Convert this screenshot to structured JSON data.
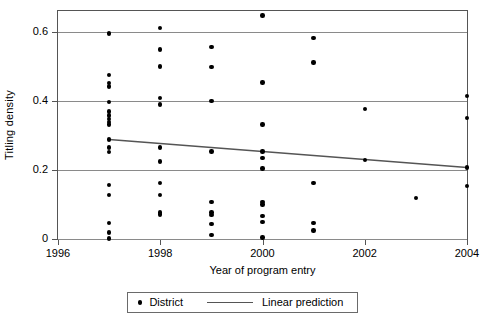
{
  "chart_data": {
    "type": "scatter",
    "title": "",
    "xlabel": "Year of program entry",
    "ylabel": "Titling density",
    "xlim": [
      1996,
      2004
    ],
    "ylim": [
      0,
      0.66
    ],
    "xticks": [
      1996,
      1998,
      2000,
      2002,
      2004
    ],
    "xtick_labels": [
      "1996",
      "1998",
      "2000",
      "2002",
      "2004"
    ],
    "yticks": [
      0,
      0.2,
      0.4,
      0.6
    ],
    "ytick_labels": [
      "0",
      "0.2",
      "0.4",
      "0.6"
    ],
    "grid": "horizontal",
    "legend_position": "below",
    "series": [
      {
        "name": "District",
        "type": "scatter",
        "marker": "circle",
        "color": "#000000",
        "points": [
          [
            1997,
            0.595
          ],
          [
            1997,
            0.475
          ],
          [
            1997,
            0.452
          ],
          [
            1997,
            0.442
          ],
          [
            1997,
            0.396
          ],
          [
            1997,
            0.369
          ],
          [
            1997,
            0.357
          ],
          [
            1997,
            0.347
          ],
          [
            1997,
            0.338
          ],
          [
            1997,
            0.331
          ],
          [
            1997,
            0.288
          ],
          [
            1997,
            0.265
          ],
          [
            1997,
            0.252
          ],
          [
            1997,
            0.157
          ],
          [
            1997,
            0.127
          ],
          [
            1997,
            0.046
          ],
          [
            1997,
            0.019
          ],
          [
            1997,
            0.001
          ],
          [
            1998,
            0.611
          ],
          [
            1998,
            0.549
          ],
          [
            1998,
            0.499
          ],
          [
            1998,
            0.408
          ],
          [
            1998,
            0.389
          ],
          [
            1998,
            0.265
          ],
          [
            1998,
            0.224
          ],
          [
            1998,
            0.163
          ],
          [
            1998,
            0.127
          ],
          [
            1998,
            0.077
          ],
          [
            1998,
            0.071
          ],
          [
            1999,
            0.556
          ],
          [
            1999,
            0.498
          ],
          [
            1999,
            0.4
          ],
          [
            1999,
            0.253
          ],
          [
            1999,
            0.108
          ],
          [
            1999,
            0.077
          ],
          [
            1999,
            0.07
          ],
          [
            1999,
            0.044
          ],
          [
            1999,
            0.012
          ],
          [
            2000,
            0.647
          ],
          [
            2000,
            0.453
          ],
          [
            2000,
            0.331
          ],
          [
            2000,
            0.253
          ],
          [
            2000,
            0.234
          ],
          [
            2000,
            0.204
          ],
          [
            2000,
            0.107
          ],
          [
            2000,
            0.1
          ],
          [
            2000,
            0.067
          ],
          [
            2000,
            0.05
          ],
          [
            2000,
            0.004
          ],
          [
            2001,
            0.581
          ],
          [
            2001,
            0.511
          ],
          [
            2001,
            0.163
          ],
          [
            2001,
            0.046
          ],
          [
            2001,
            0.025
          ],
          [
            2002,
            0.377
          ],
          [
            2002,
            0.229
          ],
          [
            2003,
            0.119
          ],
          [
            2004,
            0.414
          ],
          [
            2004,
            0.351
          ],
          [
            2004,
            0.207
          ],
          [
            2004,
            0.153
          ]
        ]
      },
      {
        "name": "Linear prediction",
        "type": "line",
        "color": "#555555",
        "endpoints": [
          [
            1997,
            0.288
          ],
          [
            2004,
            0.207
          ]
        ]
      }
    ]
  },
  "legend": {
    "items": [
      {
        "label": "District",
        "marker": "dot"
      },
      {
        "label": "Linear prediction",
        "marker": "line"
      }
    ]
  }
}
